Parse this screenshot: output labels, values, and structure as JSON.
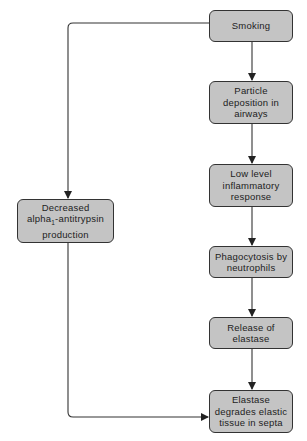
{
  "diagram": {
    "type": "flowchart",
    "nodes": [
      {
        "id": "smoking",
        "label": "Smoking"
      },
      {
        "id": "particle",
        "label": "Particle\ndeposition in\nairways"
      },
      {
        "id": "inflammatory",
        "label": "Low level\ninflammatory\nresponse"
      },
      {
        "id": "phagocytosis",
        "label": "Phagocytosis by\nneutrophils"
      },
      {
        "id": "release",
        "label": "Release of\nelastase"
      },
      {
        "id": "degrades",
        "label": "Elastase\ndegrades elastic\ntissue in septa"
      },
      {
        "id": "decreased",
        "label_line1": "Decreased",
        "label_line2_pre": "alpha",
        "label_line2_sub": "1",
        "label_line2_post": "-antitrypsin",
        "label_line3": "production"
      }
    ],
    "edges": [
      {
        "from": "smoking",
        "to": "particle"
      },
      {
        "from": "particle",
        "to": "inflammatory"
      },
      {
        "from": "inflammatory",
        "to": "phagocytosis"
      },
      {
        "from": "phagocytosis",
        "to": "release"
      },
      {
        "from": "release",
        "to": "degrades"
      },
      {
        "from": "smoking",
        "to": "decreased"
      },
      {
        "from": "decreased",
        "to": "degrades"
      }
    ]
  }
}
